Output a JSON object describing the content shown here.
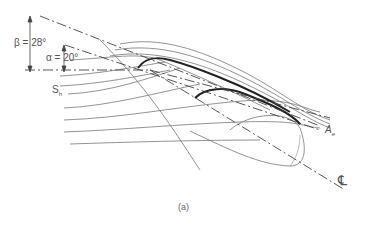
{
  "labels": {
    "beta": "β = 28°",
    "alpha": "α = 20°",
    "sh": "S",
    "sh_sub": "h",
    "ae": "A",
    "ae_sub": "e",
    "centerline": "℄",
    "caption": "(a)"
  },
  "angles": {
    "beta_deg": 28,
    "alpha_deg": 20
  }
}
